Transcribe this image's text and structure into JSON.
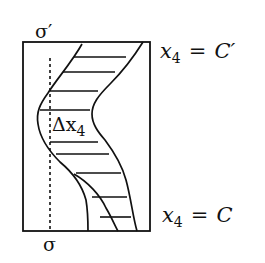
{
  "diagram": {
    "labels": {
      "top_surface": "σ′",
      "bottom_surface": "σ",
      "delta": "Δx",
      "delta_sub": "4",
      "top_eq_var": "x",
      "top_eq_sub": "4",
      "top_eq_op": "=",
      "top_eq_rhs": "C′",
      "bottom_eq_var": "x",
      "bottom_eq_sub": "4",
      "bottom_eq_op": "=",
      "bottom_eq_rhs": "C"
    },
    "colors": {
      "stroke": "#111111",
      "background": "#ffffff"
    }
  }
}
